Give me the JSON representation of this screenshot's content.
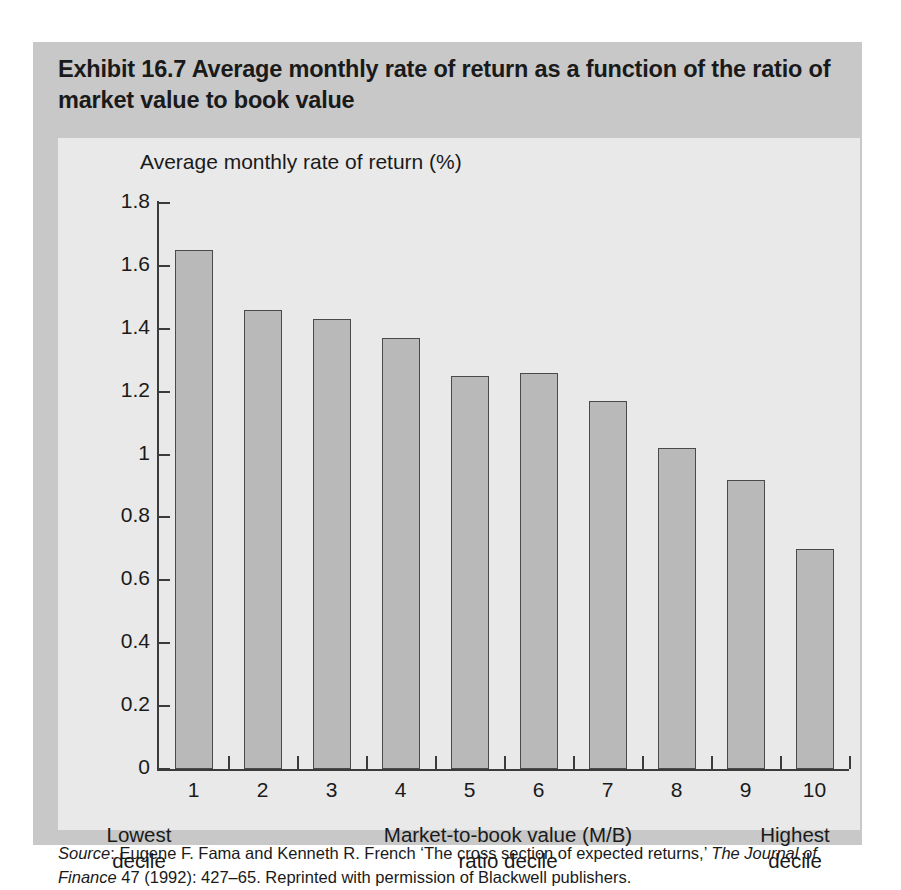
{
  "exhibit": {
    "title": "Exhibit 16.7  Average monthly rate of return as a function of the ratio of market value to book value",
    "source_prefix": "Source",
    "source_rest": ": Eugene F. Fama and Kenneth R. French ‘The cross section of expected returns,’ ",
    "source_italic": "The Journal of Finance",
    "source_tail": " 47 (1992): 427–65. Reprinted with permission of Blackwell publishers."
  },
  "captions": {
    "lowest": "Lowest\ndecile",
    "center": "Market-to-book value (M/B)\nratio decile",
    "highest": "Highest\ndecile"
  },
  "colors": {
    "panel": "#c8c8c8",
    "card": "#e9e9e9",
    "bar_fill": "#b9b9b9",
    "bar_stroke": "#4a4a4a",
    "axis": "#3b3b3b",
    "text": "#1a1a1a"
  },
  "chart_data": {
    "type": "bar",
    "title": "Average monthly rate of return as a function of the ratio of market value to book value",
    "ylabel": "Average monthly rate of return (%)",
    "xlabel": "Market-to-book value (M/B) ratio decile",
    "categories": [
      "1",
      "2",
      "3",
      "4",
      "5",
      "6",
      "7",
      "8",
      "9",
      "10"
    ],
    "values": [
      1.65,
      1.46,
      1.43,
      1.37,
      1.25,
      1.26,
      1.17,
      1.02,
      0.92,
      0.7
    ],
    "ylim": [
      0,
      1.8
    ],
    "yticks": [
      "0",
      "0.2",
      "0.4",
      "0.6",
      "0.8",
      "1",
      "1.2",
      "1.4",
      "1.6",
      "1.8"
    ],
    "ytick_values": [
      0,
      0.2,
      0.4,
      0.6,
      0.8,
      1,
      1.2,
      1.4,
      1.6,
      1.8
    ],
    "grid": false,
    "legend": null,
    "annotations": [
      "Lowest decile",
      "Highest decile"
    ]
  }
}
